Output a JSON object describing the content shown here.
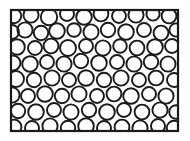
{
  "figure": {
    "name": "circle-packing-microstructure",
    "background_color": "#ffffff",
    "ink_color": "#1a1a1a",
    "caption": ""
  },
  "chart_data": {
    "type": "scatter",
    "title": "",
    "subtitle": "",
    "xlabel": "",
    "ylabel": "",
    "grid": false,
    "legend": null,
    "annotations": [],
    "frame": {
      "x": 11,
      "y": 10,
      "width": 167,
      "height": 121,
      "stroke_color": "#1a1a1a",
      "stroke_width": 2.2,
      "fill_color": "#ffffff"
    },
    "marker": {
      "shape": "circle",
      "fill": "none",
      "stroke_color": "#1a1a1a",
      "stroke_width": 1.9,
      "radius_range": [
        6.0,
        8.4
      ]
    },
    "xlim": [
      11,
      178
    ],
    "ylim": [
      10,
      131
    ],
    "count": 56,
    "circles": [
      {
        "cx": 14,
        "cy": 16,
        "r": 7.2
      },
      {
        "cx": 31,
        "cy": 15,
        "r": 7.6
      },
      {
        "cx": 49,
        "cy": 17,
        "r": 8.2
      },
      {
        "cx": 67,
        "cy": 14,
        "r": 7.0
      },
      {
        "cx": 84,
        "cy": 17,
        "r": 7.8
      },
      {
        "cx": 101,
        "cy": 14,
        "r": 7.4
      },
      {
        "cx": 119,
        "cy": 16,
        "r": 7.0
      },
      {
        "cx": 136,
        "cy": 15,
        "r": 7.6
      },
      {
        "cx": 153,
        "cy": 14,
        "r": 6.6
      },
      {
        "cx": 169,
        "cy": 16,
        "r": 7.4
      },
      {
        "cx": 12,
        "cy": 32,
        "r": 7.0
      },
      {
        "cx": 25,
        "cy": 30,
        "r": 7.6
      },
      {
        "cx": 41,
        "cy": 33,
        "r": 7.2
      },
      {
        "cx": 57,
        "cy": 31,
        "r": 7.8
      },
      {
        "cx": 74,
        "cy": 30,
        "r": 6.8
      },
      {
        "cx": 91,
        "cy": 32,
        "r": 7.6
      },
      {
        "cx": 108,
        "cy": 30,
        "r": 7.2
      },
      {
        "cx": 126,
        "cy": 32,
        "r": 7.8
      },
      {
        "cx": 144,
        "cy": 30,
        "r": 7.0
      },
      {
        "cx": 161,
        "cy": 33,
        "r": 7.4
      },
      {
        "cx": 176,
        "cy": 30,
        "r": 6.6
      },
      {
        "cx": 17,
        "cy": 47,
        "r": 7.8
      },
      {
        "cx": 35,
        "cy": 48,
        "r": 7.0
      },
      {
        "cx": 51,
        "cy": 46,
        "r": 7.4
      },
      {
        "cx": 68,
        "cy": 48,
        "r": 8.0
      },
      {
        "cx": 86,
        "cy": 46,
        "r": 7.0
      },
      {
        "cx": 103,
        "cy": 48,
        "r": 7.6
      },
      {
        "cx": 120,
        "cy": 46,
        "r": 6.8
      },
      {
        "cx": 137,
        "cy": 48,
        "r": 7.4
      },
      {
        "cx": 155,
        "cy": 47,
        "r": 7.8
      },
      {
        "cx": 172,
        "cy": 46,
        "r": 7.0
      },
      {
        "cx": 13,
        "cy": 63,
        "r": 7.4
      },
      {
        "cx": 30,
        "cy": 64,
        "r": 7.8
      },
      {
        "cx": 47,
        "cy": 62,
        "r": 7.0
      },
      {
        "cx": 64,
        "cy": 64,
        "r": 7.6
      },
      {
        "cx": 81,
        "cy": 61,
        "r": 7.2
      },
      {
        "cx": 99,
        "cy": 63,
        "r": 7.8
      },
      {
        "cx": 117,
        "cy": 62,
        "r": 7.0
      },
      {
        "cx": 134,
        "cy": 64,
        "r": 7.6
      },
      {
        "cx": 151,
        "cy": 62,
        "r": 7.2
      },
      {
        "cx": 168,
        "cy": 64,
        "r": 7.6
      },
      {
        "cx": 16,
        "cy": 79,
        "r": 8.0
      },
      {
        "cx": 34,
        "cy": 80,
        "r": 7.2
      },
      {
        "cx": 52,
        "cy": 78,
        "r": 7.6
      },
      {
        "cx": 69,
        "cy": 80,
        "r": 7.0
      },
      {
        "cx": 86,
        "cy": 78,
        "r": 7.8
      },
      {
        "cx": 104,
        "cy": 80,
        "r": 7.2
      },
      {
        "cx": 121,
        "cy": 78,
        "r": 7.6
      },
      {
        "cx": 139,
        "cy": 80,
        "r": 7.0
      },
      {
        "cx": 156,
        "cy": 78,
        "r": 7.4
      },
      {
        "cx": 174,
        "cy": 80,
        "r": 7.0
      },
      {
        "cx": 12,
        "cy": 95,
        "r": 7.6
      },
      {
        "cx": 28,
        "cy": 96,
        "r": 7.0
      },
      {
        "cx": 45,
        "cy": 94,
        "r": 7.8
      },
      {
        "cx": 62,
        "cy": 96,
        "r": 7.2
      },
      {
        "cx": 79,
        "cy": 94,
        "r": 7.6
      },
      {
        "cx": 97,
        "cy": 96,
        "r": 7.0
      },
      {
        "cx": 114,
        "cy": 94,
        "r": 7.4
      },
      {
        "cx": 131,
        "cy": 96,
        "r": 7.8
      },
      {
        "cx": 149,
        "cy": 94,
        "r": 7.0
      },
      {
        "cx": 166,
        "cy": 96,
        "r": 7.6
      },
      {
        "cx": 18,
        "cy": 111,
        "r": 7.2
      },
      {
        "cx": 36,
        "cy": 112,
        "r": 7.8
      },
      {
        "cx": 54,
        "cy": 110,
        "r": 7.0
      },
      {
        "cx": 71,
        "cy": 112,
        "r": 7.6
      },
      {
        "cx": 89,
        "cy": 110,
        "r": 7.2
      },
      {
        "cx": 107,
        "cy": 112,
        "r": 7.8
      },
      {
        "cx": 124,
        "cy": 110,
        "r": 7.0
      },
      {
        "cx": 142,
        "cy": 112,
        "r": 7.4
      },
      {
        "cx": 160,
        "cy": 110,
        "r": 7.6
      },
      {
        "cx": 176,
        "cy": 112,
        "r": 6.8
      },
      {
        "cx": 14,
        "cy": 127,
        "r": 7.4
      },
      {
        "cx": 32,
        "cy": 128,
        "r": 7.0
      },
      {
        "cx": 50,
        "cy": 126,
        "r": 7.6
      },
      {
        "cx": 68,
        "cy": 128,
        "r": 7.2
      },
      {
        "cx": 86,
        "cy": 126,
        "r": 7.8
      },
      {
        "cx": 104,
        "cy": 128,
        "r": 7.0
      },
      {
        "cx": 122,
        "cy": 127,
        "r": 7.4
      },
      {
        "cx": 140,
        "cy": 128,
        "r": 7.6
      },
      {
        "cx": 158,
        "cy": 126,
        "r": 7.0
      },
      {
        "cx": 174,
        "cy": 128,
        "r": 7.2
      }
    ]
  }
}
